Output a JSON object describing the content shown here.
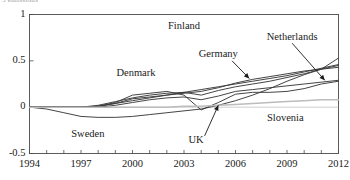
{
  "figure": {
    "clipped_top_text": "5 emissions",
    "background": "#ffffff",
    "line_color": "#3a3a3a",
    "axis_color": "#4a4a4a",
    "text_color": "#1a1a1a"
  },
  "chart_data": {
    "type": "line",
    "title": "",
    "subtitle": "",
    "xlabel": "",
    "ylabel": "",
    "xlim": [
      1994,
      2012
    ],
    "ylim": [
      -0.5,
      1
    ],
    "grid": false,
    "legend": "inline-annotations",
    "xticks": [
      1994,
      1995,
      1996,
      1997,
      1998,
      1999,
      2000,
      2001,
      2002,
      2003,
      2004,
      2005,
      2006,
      2007,
      2008,
      2009,
      2010,
      2011,
      2012
    ],
    "xticklabels": [
      "1994",
      "",
      "",
      "1997",
      "",
      "",
      "2000",
      "",
      "",
      "2003",
      "",
      "",
      "2006",
      "",
      "",
      "2009",
      "",
      "",
      "2012"
    ],
    "xticklabels_shown": [
      "1994",
      "1997",
      "2000",
      "2003",
      "2006",
      "2009",
      "2012"
    ],
    "yticks": [
      -0.5,
      0,
      0.5,
      1
    ],
    "yticklabels": [
      "-0.5",
      "0",
      "0.5",
      "1"
    ],
    "x": [
      1994,
      1995,
      1996,
      1997,
      1998,
      1999,
      2000,
      2001,
      2002,
      2003,
      2004,
      2005,
      2006,
      2007,
      2008,
      2009,
      2010,
      2011,
      2012
    ],
    "series": [
      {
        "name": "Finland",
        "label_x": 2003.0,
        "label_y": 0.86,
        "arrow": false,
        "values": [
          0.0,
          0.0,
          0.0,
          0.0,
          0.01,
          0.04,
          0.09,
          0.11,
          0.13,
          0.16,
          0.19,
          0.22,
          0.25,
          0.28,
          0.31,
          0.34,
          0.38,
          0.42,
          0.46
        ]
      },
      {
        "name": "Netherlands",
        "label_x": 2009.3,
        "label_y": 0.75,
        "arrow": true,
        "arrow_from": [
          2009.3,
          0.69
        ],
        "arrow_to": [
          2011.2,
          0.29
        ],
        "values": [
          0.0,
          0.0,
          0.0,
          0.0,
          0.0,
          0.02,
          0.05,
          0.08,
          0.1,
          0.11,
          0.08,
          0.12,
          0.17,
          0.19,
          0.21,
          0.23,
          0.25,
          0.27,
          0.29
        ]
      },
      {
        "name": "Germany",
        "label_x": 2005.0,
        "label_y": 0.56,
        "arrow": true,
        "arrow_from": [
          2005.8,
          0.5
        ],
        "arrow_to": [
          2006.8,
          0.31
        ],
        "values": [
          0.0,
          0.0,
          0.0,
          0.0,
          0.01,
          0.04,
          0.07,
          0.1,
          0.13,
          0.15,
          0.17,
          0.21,
          0.26,
          0.3,
          0.33,
          0.36,
          0.39,
          0.41,
          0.43
        ]
      },
      {
        "name": "Denmark",
        "label_x": 2000.2,
        "label_y": 0.36,
        "arrow": false,
        "values": [
          0.0,
          0.0,
          0.0,
          0.0,
          0.02,
          0.06,
          0.1,
          0.13,
          0.15,
          0.16,
          0.13,
          0.18,
          0.22,
          0.25,
          0.28,
          0.32,
          0.36,
          0.41,
          0.53
        ]
      },
      {
        "name": "Sweden",
        "label_x": 1997.4,
        "label_y": -0.3,
        "arrow": false,
        "values": [
          0.0,
          -0.02,
          -0.06,
          -0.1,
          -0.11,
          -0.11,
          -0.1,
          -0.08,
          -0.06,
          -0.04,
          -0.02,
          0.02,
          0.07,
          0.13,
          0.2,
          0.28,
          0.35,
          0.41,
          0.45
        ]
      },
      {
        "name": "UK",
        "label_x": 2003.7,
        "label_y": -0.37,
        "arrow": true,
        "arrow_from": [
          2004.2,
          -0.31
        ],
        "arrow_to": [
          2005.0,
          0.02
        ],
        "values": [
          0.0,
          0.0,
          0.0,
          0.0,
          0.01,
          0.05,
          0.13,
          0.15,
          0.17,
          0.13,
          -0.03,
          0.05,
          0.14,
          0.16,
          0.16,
          0.17,
          0.2,
          0.25,
          0.28
        ]
      },
      {
        "name": "Slovenia",
        "label_x": 2008.9,
        "label_y": -0.13,
        "arrow": false,
        "values": [
          0.0,
          0.0,
          0.0,
          0.0,
          0.0,
          0.0,
          0.0,
          0.0,
          0.0,
          0.01,
          0.01,
          0.02,
          0.03,
          0.04,
          0.05,
          0.06,
          0.07,
          0.08,
          0.08
        ]
      }
    ]
  }
}
